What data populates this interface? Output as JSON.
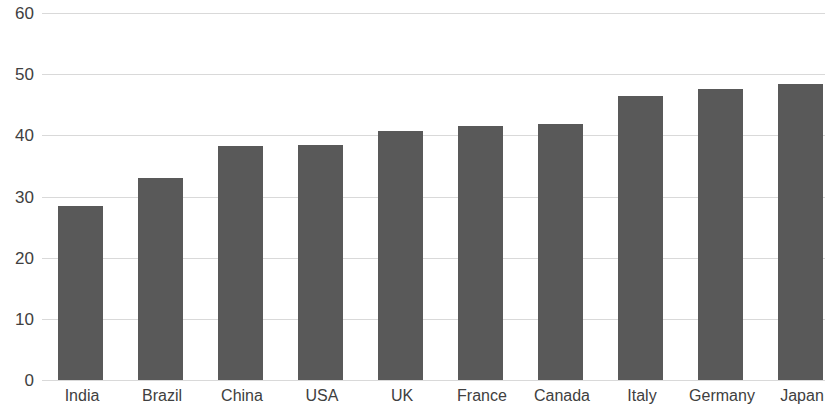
{
  "chart_data": {
    "type": "bar",
    "title": "",
    "subtitle": "",
    "xlabel": "",
    "ylabel": "",
    "categories": [
      "India",
      "Brazil",
      "China",
      "USA",
      "UK",
      "France",
      "Canada",
      "Italy",
      "Germany",
      "Japan"
    ],
    "values": [
      28.5,
      33.0,
      38.2,
      38.5,
      40.7,
      41.5,
      41.8,
      46.4,
      47.5,
      48.4
    ],
    "series": [
      {
        "name": "",
        "values": [
          28.5,
          33.0,
          38.2,
          38.5,
          40.7,
          41.5,
          41.8,
          46.4,
          47.5,
          48.4
        ]
      }
    ],
    "ylim": [
      0,
      60
    ],
    "y_ticks": [
      0,
      10,
      20,
      30,
      40,
      50,
      60
    ],
    "y_tick_labels": [
      "0",
      "10",
      "20",
      "30",
      "40",
      "50",
      "60"
    ],
    "x_tick_labels": [
      "India",
      "Brazil",
      "China",
      "USA",
      "UK",
      "France",
      "Canada",
      "Italy",
      "Germany",
      "Japan"
    ],
    "grid": "horizontal",
    "legend": "none",
    "annotations": [],
    "colors": {
      "bar": "#595959",
      "gridline": "#d9d9d9",
      "background": "#ffffff",
      "tick_label": "#404040"
    }
  }
}
